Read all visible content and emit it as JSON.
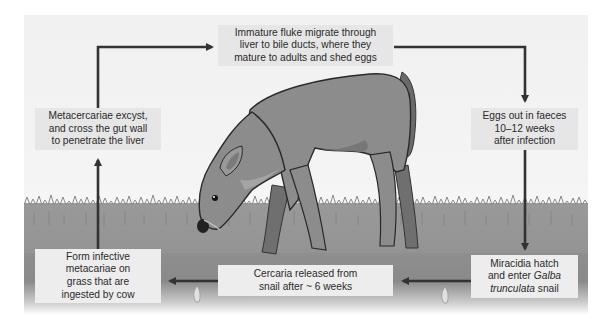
{
  "diagram": {
    "steps": [
      {
        "id": "immature-fluke",
        "lines": [
          "Immature fluke migrate through",
          "liver to bile ducts, where they",
          "mature to adults and shed eggs"
        ]
      },
      {
        "id": "eggs-out",
        "lines": [
          "Eggs out in faeces",
          "10–12 weeks",
          "after infection"
        ]
      },
      {
        "id": "miracidia",
        "lines": [
          "Miracidia hatch",
          "and enter ",
          "Galba",
          "trunculata",
          " snail"
        ]
      },
      {
        "id": "cercaria",
        "lines": [
          "Cercaria released from",
          "snail after ~ 6 weeks"
        ]
      },
      {
        "id": "form-infective",
        "lines": [
          "Form infective",
          "metacariae on",
          "grass that are",
          "ingested by cow"
        ]
      },
      {
        "id": "metacercariae",
        "lines": [
          "Metacercariae excyst,",
          "and cross the gut wall",
          "to penetrate the liver"
        ]
      }
    ],
    "flow": [
      "metacercariae",
      "immature-fluke",
      "eggs-out",
      "miracidia",
      "cercaria",
      "form-infective",
      "metacercariae"
    ],
    "illustration": "grazing-calf-on-grass",
    "colors": {
      "background": "#f2f2f2",
      "box": "#e6e6e6",
      "arrow": "#333333",
      "text": "#2b2b2b",
      "grass": "#8f8f8f",
      "cow": "#8c8c8c"
    }
  }
}
